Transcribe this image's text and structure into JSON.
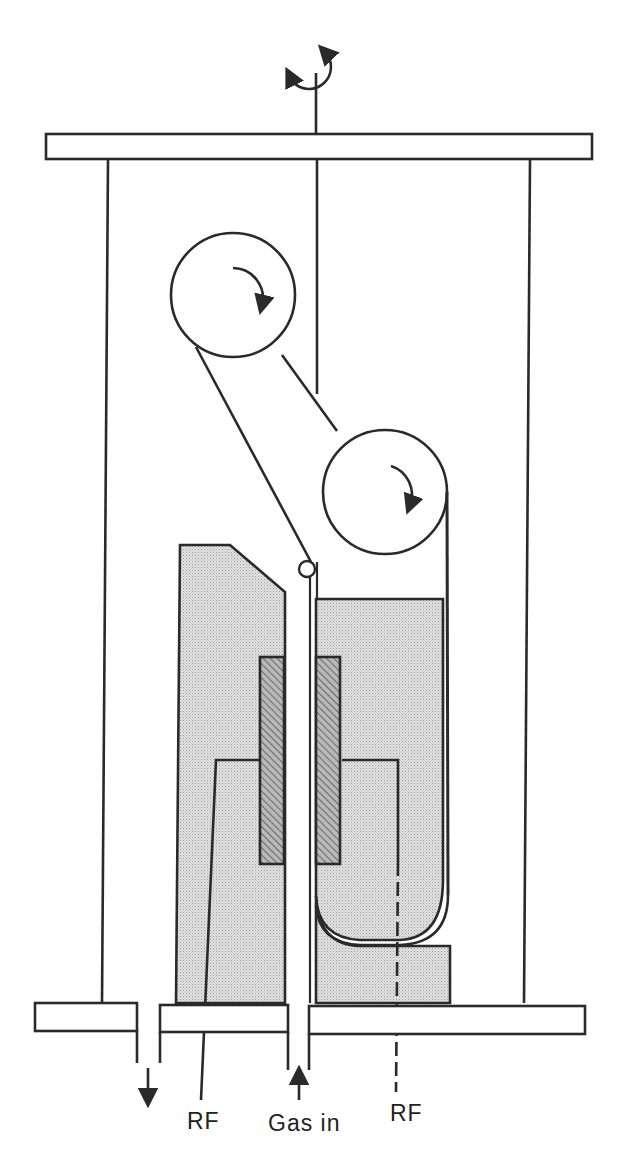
{
  "diagram": {
    "type": "schematic",
    "labels": {
      "rf_left": "RF",
      "gas_in": "Gas in",
      "rf_right": "RF"
    },
    "components": [
      "top-plate",
      "base-plate",
      "chamber-wall-left",
      "chamber-wall-right",
      "rotation-shaft",
      "upper-roller",
      "lower-roller",
      "web-guide-pin",
      "left-electrode-block",
      "right-electrode-block",
      "left-dielectric-insert",
      "right-dielectric-insert",
      "gas-inlet-channel",
      "exhaust-port"
    ],
    "colors": {
      "line": "#2a2a2a",
      "fill_dotted": "#d8d8d8",
      "fill_hatched": "#a8a8a8",
      "background": "#ffffff"
    }
  }
}
